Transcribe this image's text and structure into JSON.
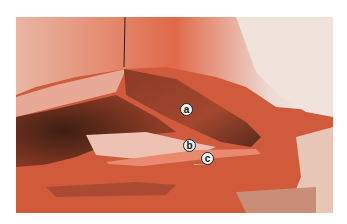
{
  "image": {
    "description": "Surgical dissection photograph with labeled anatomical structures",
    "colors": {
      "tissue_red": "#d4553a",
      "tissue_light": "#e8a08a",
      "pale": "#efe5df",
      "dark": "#4a2418",
      "background": "#ffffff"
    }
  },
  "labels": [
    {
      "id": "a",
      "text": "a"
    },
    {
      "id": "b",
      "text": "b"
    },
    {
      "id": "c",
      "text": "c"
    }
  ]
}
